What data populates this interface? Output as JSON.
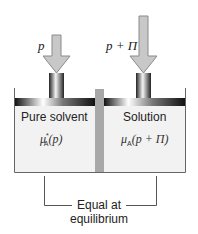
{
  "diagram": {
    "left_arrow_label": "p",
    "right_arrow_label": "p + Π",
    "left_compartment": {
      "title": "Pure solvent",
      "potential_symbol": "μ",
      "potential_sup": "*",
      "potential_sub": "A",
      "potential_arg": "(p)"
    },
    "right_compartment": {
      "title": "Solution",
      "potential_symbol": "μ",
      "potential_sub": "A",
      "potential_arg": "(p + Π)"
    },
    "bracket_label_line1": "Equal at",
    "bracket_label_line2": "equilibrium",
    "colors": {
      "compartment_fill": "#f2f2f2",
      "divider": "#a8a8a8",
      "arrow_fill": "#c8c8c8",
      "arrow_stroke": "#8a8a8a",
      "outline": "#666666"
    }
  }
}
